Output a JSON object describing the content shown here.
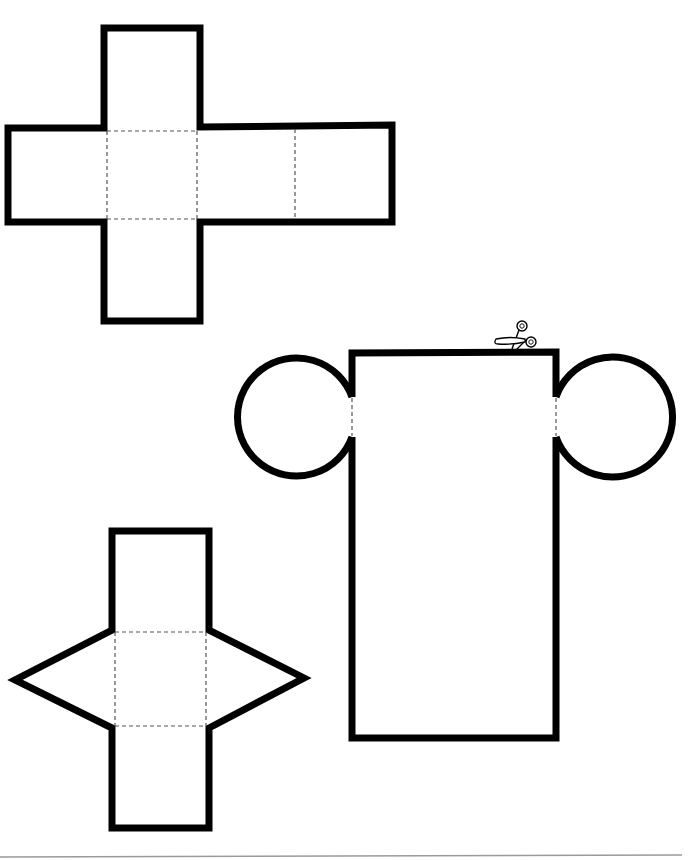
{
  "sheet": {
    "background": "#ffffff",
    "outline_color": "#000000",
    "fold_line_color": "#555555",
    "nets": [
      {
        "id": "cube-net",
        "shape": "cube",
        "faces": 6,
        "layout": "cross"
      },
      {
        "id": "cylinder-net",
        "shape": "cylinder",
        "faces": 3,
        "layout": "rectangle with two circular bases",
        "marker": "scissors-icon"
      },
      {
        "id": "triangular-prism-net",
        "shape": "triangular prism",
        "faces": 5,
        "layout": "three rectangles with two triangles"
      }
    ]
  }
}
